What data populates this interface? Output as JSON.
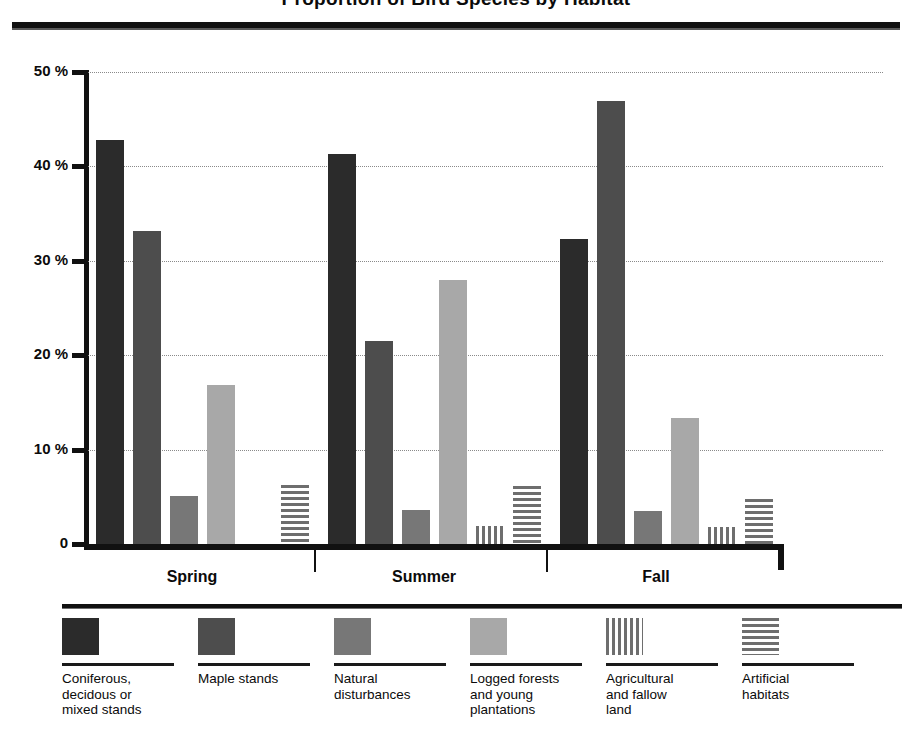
{
  "title": "Proportion of Bird Species by Habitat",
  "axis": {
    "y_ticks": [
      "50 %",
      "40 %",
      "30 %",
      "20 %",
      "10 %",
      "0"
    ],
    "x_groups": [
      "Spring",
      "Summer",
      "Fall"
    ]
  },
  "legend": {
    "items": [
      {
        "label": "Coniferous,\ndecidous or\nmixed stands",
        "swatch": "solid-dark-swatch",
        "color": "#2b2b2b"
      },
      {
        "label": "Maple stands",
        "swatch": "solid-medium-dark-swatch",
        "color": "#4d4d4d"
      },
      {
        "label": "Natural\ndisturbances",
        "swatch": "solid-medium-swatch",
        "color": "#777777"
      },
      {
        "label": "Logged forests\nand young\nplantations",
        "swatch": "solid-light-swatch",
        "color": "#a8a8a8"
      },
      {
        "label": "Agricultural\nand fallow\nland",
        "swatch": "vertical-stripes-swatch",
        "color": "#6e6e6e"
      },
      {
        "label": "Artificial\nhabitats",
        "swatch": "horizontal-stripes-swatch",
        "color": "#6e6e6e"
      }
    ]
  },
  "chart_data": {
    "type": "bar",
    "title": "Proportion of Bird Species by Habitat",
    "xlabel": "",
    "ylabel": "",
    "ylim": [
      0,
      50
    ],
    "yticks": [
      0,
      10,
      20,
      30,
      40,
      50
    ],
    "ytick_labels": [
      "0",
      "10 %",
      "20 %",
      "30 %",
      "40 %",
      "50 %"
    ],
    "grid": true,
    "legend_position": "bottom",
    "categories": [
      "Spring",
      "Summer",
      "Fall"
    ],
    "series": [
      {
        "name": "Coniferous, decidous or mixed stands",
        "values": [
          42.8,
          41.3,
          32.3
        ],
        "color": "#2b2b2b",
        "pattern": "solid"
      },
      {
        "name": "Maple stands",
        "values": [
          33.2,
          21.5,
          46.9
        ],
        "color": "#4d4d4d",
        "pattern": "solid"
      },
      {
        "name": "Natural disturbances",
        "values": [
          5.1,
          3.6,
          3.5
        ],
        "color": "#777777",
        "pattern": "solid"
      },
      {
        "name": "Logged forests and young plantations",
        "values": [
          16.8,
          28.0,
          13.3
        ],
        "color": "#a8a8a8",
        "pattern": "solid"
      },
      {
        "name": "Agricultural and fallow land",
        "values": [
          0,
          1.9,
          1.8
        ],
        "color": "#6e6e6e",
        "pattern": "vertical-stripes"
      },
      {
        "name": "Artificial habitats",
        "values": [
          6.2,
          6.1,
          4.8
        ],
        "color": "#6e6e6e",
        "pattern": "horizontal-stripes"
      }
    ]
  }
}
